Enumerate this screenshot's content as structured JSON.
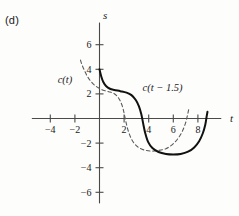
{
  "figure": {
    "panel_letter": "(d)"
  },
  "chart_data": {
    "type": "line",
    "title": "",
    "xlabel": "t",
    "ylabel": "s",
    "xlim": [
      -5.5,
      10.5
    ],
    "ylim": [
      -7.5,
      8.2
    ],
    "grid": false,
    "legend_position": "inline-annotations",
    "x_ticks": [
      -4,
      -2,
      2,
      4,
      6,
      8
    ],
    "x_tick_labels": [
      "-4",
      "-2",
      "2",
      "4",
      "6",
      "8"
    ],
    "y_ticks": [
      6,
      4,
      2,
      -2,
      -4,
      -6
    ],
    "y_tick_labels": [
      "6",
      "4",
      "2",
      "-2",
      "-4",
      "-6"
    ],
    "annotations": [
      {
        "text": "c(t)",
        "x": -3.4,
        "y": 2.85,
        "style": "italic"
      },
      {
        "text": "c(t − 1.5)",
        "x": 3.5,
        "y": 2.2,
        "style": "italic"
      }
    ],
    "series": [
      {
        "name": "c(t − 1.5)",
        "style": "solid",
        "color": "#111111",
        "width": 2.0,
        "points": [
          [
            0.0,
            4.0
          ],
          [
            0.15,
            3.4
          ],
          [
            0.32,
            2.95
          ],
          [
            0.55,
            2.62
          ],
          [
            0.85,
            2.42
          ],
          [
            1.2,
            2.32
          ],
          [
            1.7,
            2.22
          ],
          [
            2.2,
            2.1
          ],
          [
            2.6,
            1.9
          ],
          [
            2.95,
            1.5
          ],
          [
            3.2,
            1.0
          ],
          [
            3.4,
            0.35
          ],
          [
            3.55,
            -0.4
          ],
          [
            3.72,
            -1.2
          ],
          [
            3.95,
            -1.9
          ],
          [
            4.3,
            -2.4
          ],
          [
            4.8,
            -2.72
          ],
          [
            5.4,
            -2.88
          ],
          [
            6.0,
            -2.92
          ],
          [
            6.6,
            -2.88
          ],
          [
            7.2,
            -2.7
          ],
          [
            7.7,
            -2.35
          ],
          [
            8.1,
            -1.85
          ],
          [
            8.4,
            -1.2
          ],
          [
            8.6,
            -0.5
          ],
          [
            8.7,
            0.1
          ],
          [
            8.78,
            0.55
          ]
        ]
      },
      {
        "name": "c(t)",
        "style": "dashed",
        "color": "#5a5a5a",
        "width": 1.1,
        "points": [
          [
            -1.55,
            4.75
          ],
          [
            -1.4,
            4.3
          ],
          [
            -1.2,
            3.85
          ],
          [
            -1.0,
            3.45
          ],
          [
            -0.75,
            3.08
          ],
          [
            -0.45,
            2.75
          ],
          [
            -0.1,
            2.5
          ],
          [
            0.3,
            2.3
          ],
          [
            0.75,
            2.18
          ],
          [
            1.15,
            2.05
          ],
          [
            1.45,
            1.8
          ],
          [
            1.7,
            1.4
          ],
          [
            1.9,
            0.85
          ],
          [
            2.05,
            0.2
          ],
          [
            2.2,
            -0.5
          ],
          [
            2.4,
            -1.2
          ],
          [
            2.7,
            -1.85
          ],
          [
            3.1,
            -2.3
          ],
          [
            3.6,
            -2.55
          ],
          [
            4.2,
            -2.65
          ],
          [
            4.8,
            -2.6
          ],
          [
            5.4,
            -2.45
          ],
          [
            5.95,
            -2.1
          ],
          [
            6.4,
            -1.6
          ],
          [
            6.75,
            -1.0
          ],
          [
            7.0,
            -0.35
          ],
          [
            7.15,
            0.25
          ],
          [
            7.25,
            0.72
          ]
        ]
      }
    ]
  }
}
